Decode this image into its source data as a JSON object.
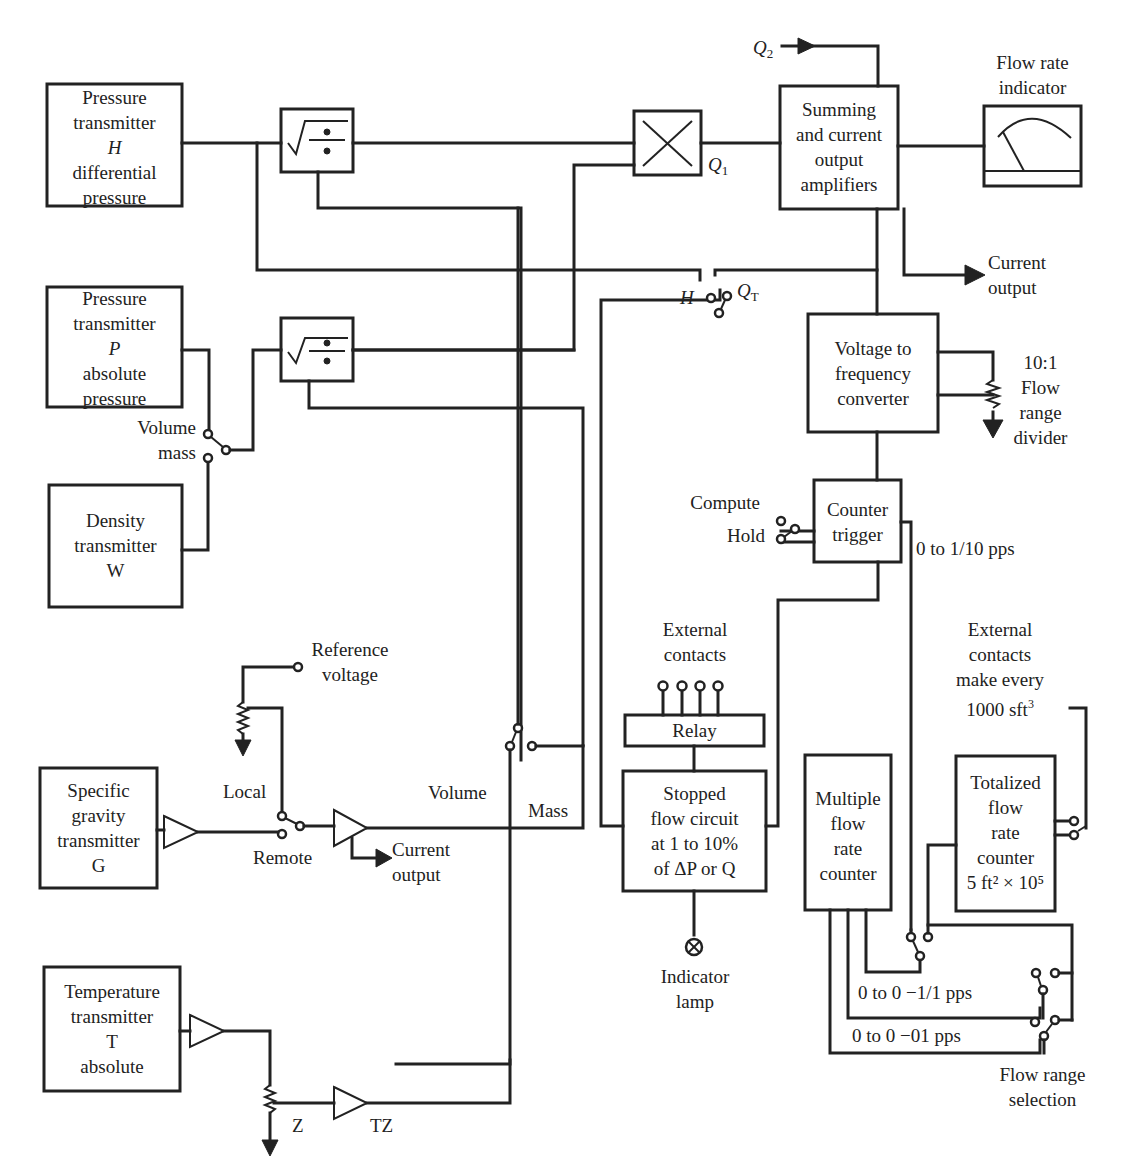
{
  "diagram": {
    "blocks": {
      "pressure_h": [
        "Pressure",
        "transmitter",
        "H",
        "differential",
        "pressure"
      ],
      "pressure_p": [
        "Pressure",
        "transmitter",
        "P",
        "absolute",
        "pressure"
      ],
      "density": [
        "Density",
        "transmitter",
        "W"
      ],
      "specific_gravity": [
        "Specific",
        "gravity",
        "transmitter",
        "G"
      ],
      "temperature": [
        "Temperature",
        "transmitter",
        "T",
        "absolute"
      ],
      "summing": [
        "Summing",
        "and current",
        "output",
        "amplifiers"
      ],
      "v2f": [
        "Voltage to",
        "frequency",
        "converter"
      ],
      "counter_trigger": [
        "Counter",
        "trigger"
      ],
      "relay": "Relay",
      "stopped_flow": [
        "Stopped",
        "flow circuit",
        "at 1 to 10%",
        "of ΔP or Q"
      ],
      "multiple_counter": [
        "Multiple",
        "flow",
        "rate",
        "counter"
      ],
      "totalized": [
        "Totalized",
        "flow",
        "rate",
        "counter"
      ],
      "totalized_scale": "5 ft² × 10⁵"
    },
    "labels": {
      "q2": "Q",
      "q2_sub": "2",
      "q1": "Q",
      "q1_sub": "1",
      "flow_rate_indicator": [
        "Flow rate",
        "indicator"
      ],
      "current_output_top": [
        "Current",
        "output"
      ],
      "h_switch": "H",
      "qt": "Q",
      "qt_sub": "T",
      "flow_range_divider": [
        "10:1",
        "Flow",
        "range",
        "divider"
      ],
      "volume_mass": [
        "Volume",
        "mass"
      ],
      "compute": "Compute",
      "hold": "Hold",
      "pps_top": "0 to 1/10 pps",
      "external_contacts_left": [
        "External",
        "contacts"
      ],
      "external_contacts_right": [
        "External",
        "contacts",
        "make every",
        "1000 sft"
      ],
      "external_contacts_right_sup": "3",
      "reference_voltage": [
        "Reference",
        "voltage"
      ],
      "local": "Local",
      "remote": "Remote",
      "current_output_mid": [
        "Current",
        "output"
      ],
      "volume": "Volume",
      "mass": "Mass",
      "indicator_lamp": [
        "Indicator",
        "lamp"
      ],
      "pps_mid": "0 to 0 −1/1 pps",
      "pps_low": "0 to 0 −01 pps",
      "flow_range_selection": [
        "Flow range",
        "selection"
      ],
      "z": "Z",
      "tz": "TZ"
    }
  }
}
